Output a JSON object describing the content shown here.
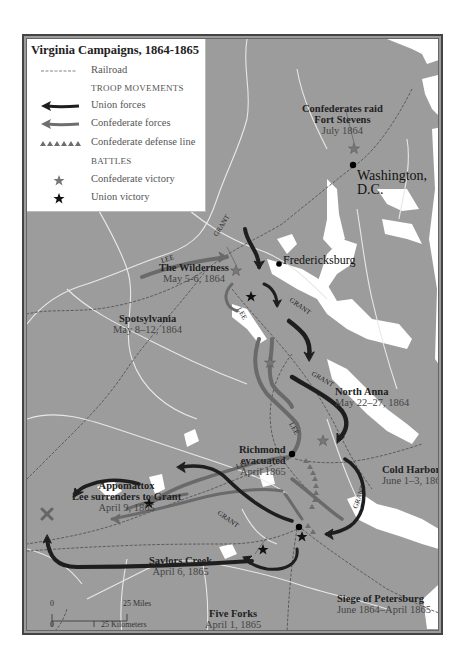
{
  "legend": {
    "title": "Virginia Campaigns, 1864-1865",
    "items": [
      {
        "label": "Railroad",
        "symbol": "railroad-line"
      },
      {
        "label": "TROOP MOVEMENTS",
        "symbol": "section-header"
      },
      {
        "label": "Union forces",
        "symbol": "union-arrow",
        "color": "#1e1e1e"
      },
      {
        "label": "Confederate forces",
        "symbol": "confederate-arrow",
        "color": "#6e6e6e"
      },
      {
        "label": "Confederate defense line",
        "symbol": "defense-line",
        "color": "#6e6e6e"
      },
      {
        "label": "BATTLES",
        "symbol": "section-header"
      },
      {
        "label": "Confederate victory",
        "symbol": "grey-star",
        "color": "#777777"
      },
      {
        "label": "Union victory",
        "symbol": "black-star",
        "color": "#111111"
      }
    ]
  },
  "colors": {
    "land": "#9c9c9c",
    "water": "#ffffff",
    "union": "#1e1e1e",
    "confederate": "#707070",
    "frame": "#444444"
  },
  "cities": [
    {
      "name": "Washington,",
      "name2": "D.C."
    },
    {
      "name": "Fredericksburg"
    }
  ],
  "battles": [
    {
      "name": "Confederates raid",
      "name2": "Fort Stevens",
      "date": "July 1864",
      "result": "Confederate victory"
    },
    {
      "name": "The Wilderness",
      "date": "May 5-6, 1864",
      "result": "Confederate victory"
    },
    {
      "name": "Spotsylvania",
      "date": "May 8–12, 1864",
      "result": "Union victory"
    },
    {
      "name": "North Anna",
      "date": "May 22–27, 1864",
      "result": "Confederate victory"
    },
    {
      "name": "Cold Harbor",
      "date": "June 1–3, 1864",
      "result": "Confederate victory"
    },
    {
      "name": "Richmond",
      "name2": "evacuated",
      "date": "April 1865"
    },
    {
      "name": "Appomattox",
      "name2": "Lee surrenders to Grant",
      "date": "April 9, 1865"
    },
    {
      "name": "Saylors Creek",
      "date": "April 6, 1865",
      "result": "Union victory"
    },
    {
      "name": "Five Forks",
      "date": "April 1, 1865",
      "result": "Union victory"
    },
    {
      "name": "Siege of Petersburg",
      "date": "June 1864–April 1865",
      "result": "Union victory"
    }
  ],
  "movement_labels": {
    "grant": "GRANT",
    "lee": "LEE"
  },
  "scale": {
    "zero": "0",
    "miles": "25 Miles",
    "km": "25 Kilometers"
  }
}
